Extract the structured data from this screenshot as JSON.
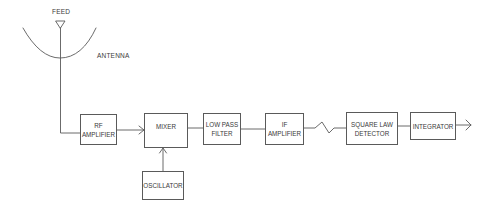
{
  "diagram": {
    "stroke_color": "#5a5a5a",
    "text_color": "#3a3a3a",
    "labels": {
      "feed": "FEED",
      "antenna": "ANTENNA"
    },
    "blocks": [
      {
        "id": "rf_amplifier",
        "line1": "RF",
        "line2": "AMPLIFIER"
      },
      {
        "id": "mixer",
        "line1": "MIXER",
        "line2": ""
      },
      {
        "id": "low_pass_filter",
        "line1": "LOW PASS",
        "line2": "FILTER"
      },
      {
        "id": "if_amplifier",
        "line1": "IF",
        "line2": "AMPLIFIER"
      },
      {
        "id": "square_law_detector",
        "line1": "SQUARE LAW",
        "line2": "DETECTOR"
      },
      {
        "id": "integrator",
        "line1": "INTEGRATOR",
        "line2": ""
      },
      {
        "id": "oscillator",
        "line1": "OSCILLATOR",
        "line2": ""
      }
    ],
    "connections": [
      {
        "from": "antenna_feed",
        "to": "rf_amplifier"
      },
      {
        "from": "rf_amplifier",
        "to": "mixer",
        "arrow": true
      },
      {
        "from": "oscillator",
        "to": "mixer",
        "arrow": true
      },
      {
        "from": "mixer",
        "to": "low_pass_filter"
      },
      {
        "from": "low_pass_filter",
        "to": "if_amplifier"
      },
      {
        "from": "if_amplifier",
        "to": "square_law_detector",
        "style": "zigzag"
      },
      {
        "from": "square_law_detector",
        "to": "integrator"
      },
      {
        "from": "integrator",
        "to": "output",
        "arrow": true
      }
    ]
  }
}
